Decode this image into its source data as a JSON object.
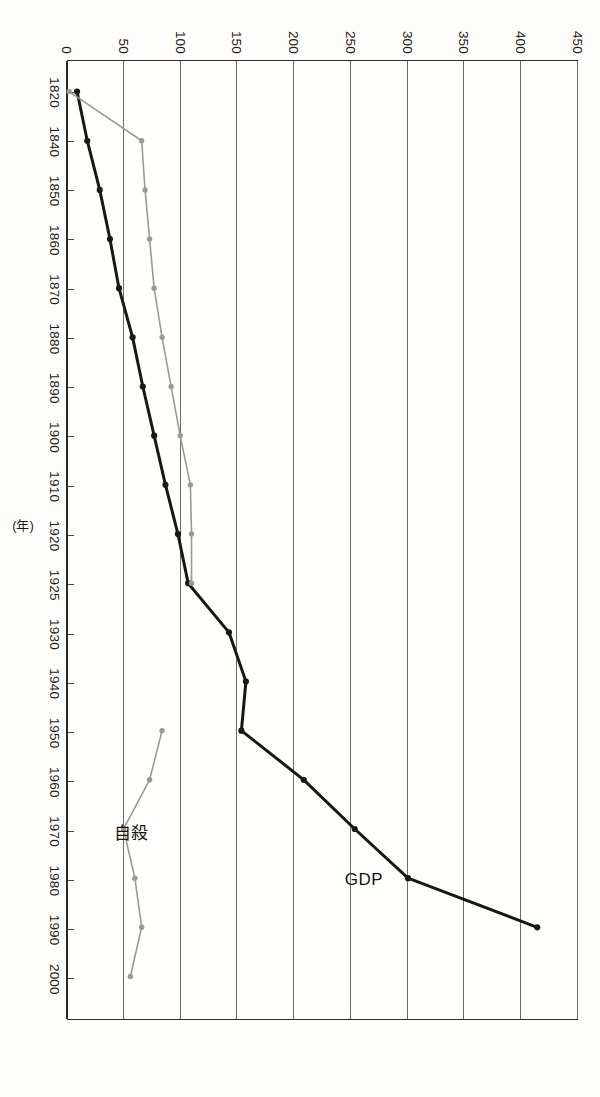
{
  "figure": {
    "rotation_degrees": 90,
    "background": "#fdfdfb",
    "frame_color": "#2e2b26",
    "grid_color": "#6f6b63"
  },
  "axis": {
    "x_title": "(年)",
    "value_ticks": [
      "0",
      "50",
      "100",
      "150",
      "200",
      "250",
      "300",
      "350",
      "400",
      "450"
    ],
    "year_ticks": [
      "1820",
      "1840",
      "1850",
      "1860",
      "1870",
      "1880",
      "1890",
      "1900",
      "1910",
      "1920",
      "1925",
      "1930",
      "1940",
      "1950",
      "1960",
      "1970",
      "1980",
      "1990",
      "2000"
    ]
  },
  "labels": {
    "gdp": "GDP",
    "suicide": "自殺"
  },
  "chart_data": {
    "type": "line",
    "title": "",
    "subtitle": "",
    "xlabel": "(年)",
    "ylabel": "",
    "ylim": [
      0,
      450
    ],
    "ytick_step": 50,
    "grid": true,
    "legend": "inline-annotation",
    "orientation": "rotated-90-clockwise",
    "categories": [
      "1820",
      "1840",
      "1850",
      "1860",
      "1870",
      "1880",
      "1890",
      "1900",
      "1910",
      "1920",
      "1925",
      "1930",
      "1940",
      "1950",
      "1960",
      "1970",
      "1980",
      "1990",
      "2000"
    ],
    "series": [
      {
        "name": "GDP",
        "color": "#1a1814",
        "values": [
          8,
          17,
          28,
          37,
          45,
          57,
          66,
          76,
          86,
          97,
          106,
          142,
          157,
          153,
          208,
          253,
          300,
          414,
          null
        ]
      },
      {
        "name": "自殺",
        "color": "#9a9a95",
        "values": [
          1,
          65,
          68,
          72,
          76,
          83,
          91,
          99,
          108,
          109,
          109,
          null,
          null,
          83,
          72,
          49,
          59,
          65,
          55
        ]
      }
    ]
  }
}
